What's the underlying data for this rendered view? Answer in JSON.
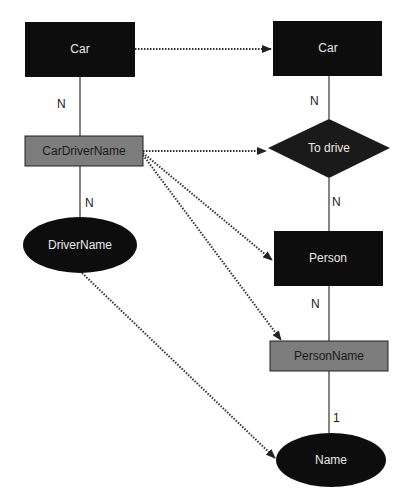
{
  "diagram": {
    "type": "er-mapping",
    "colors": {
      "entity_fill": "#0d0d0d",
      "relationship_fill": "#1a1a1a",
      "attribute_fill": "#0d0d0d",
      "link_entity_fill": "#7d7d7d",
      "entity_text": "#e8e8e8",
      "link_entity_text": "#1a1a1a",
      "line": "#333333",
      "background": "#ffffff"
    },
    "left": {
      "car": "Car",
      "car_driver_name": "CarDriverName",
      "driver_name": "DriverName",
      "card_car_cdn": "N",
      "card_cdn_driver": "N"
    },
    "right": {
      "car": "Car",
      "to_drive": "To drive",
      "person": "Person",
      "person_name": "PersonName",
      "name": "Name",
      "card_car_drive": "N",
      "card_drive_person": "N",
      "card_person_pn": "N",
      "card_pn_name": "1"
    },
    "mappings": [
      {
        "from": "Car",
        "to": "Car"
      },
      {
        "from": "CarDriverName",
        "to": "To drive"
      },
      {
        "from": "CarDriverName",
        "to": "Person"
      },
      {
        "from": "CarDriverName",
        "to": "PersonName"
      },
      {
        "from": "DriverName",
        "to": "Name"
      }
    ]
  }
}
